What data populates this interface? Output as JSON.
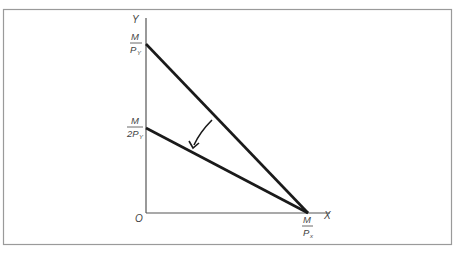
{
  "diagram": {
    "type": "budget-line-rotation",
    "axes": {
      "y_label": "Y",
      "x_label": "X",
      "origin_label": "O"
    },
    "y_intercepts": [
      {
        "numerator": "M",
        "denominator": "P",
        "subscript": "Y"
      },
      {
        "numerator": "M",
        "denominator": "2P",
        "subscript": "Y"
      }
    ],
    "x_intercept": {
      "numerator": "M",
      "denominator": "P",
      "subscript": "x"
    },
    "lines": [
      {
        "name": "original budget line",
        "from": "M/P_Y",
        "to": "M/P_x"
      },
      {
        "name": "new budget line",
        "from": "M/2P_Y",
        "to": "M/P_x"
      }
    ],
    "arrow": "budget line pivots inward about x-intercept",
    "colors": {
      "line": "#1a1a1a",
      "axis": "#555555",
      "frame": "#9a9a9a",
      "text": "#444444"
    }
  }
}
